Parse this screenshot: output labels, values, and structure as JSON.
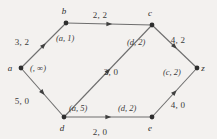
{
  "figure": {
    "type": "flow-network-diagram",
    "background_color": "#f3f1ef",
    "edge_color": "#6e6e6e",
    "node_color": "#2e2e2e",
    "text_color": "#3b3b3b"
  },
  "nodes": [
    {
      "id": "a",
      "label": "a",
      "x": 21,
      "y": 68,
      "label_dx": -11,
      "label_dy": -4
    },
    {
      "id": "b",
      "label": "b",
      "x": 66,
      "y": 23,
      "label_dx": -2,
      "label_dy": -16
    },
    {
      "id": "c",
      "label": "c",
      "x": 152,
      "y": 25,
      "label_dx": -2,
      "label_dy": -16
    },
    {
      "id": "d",
      "label": "d",
      "x": 64,
      "y": 117,
      "label_dx": -2,
      "label_dy": 7
    },
    {
      "id": "e",
      "label": "e",
      "x": 152,
      "y": 117,
      "label_dx": -2,
      "label_dy": 7
    },
    {
      "id": "z",
      "label": "z",
      "x": 197,
      "y": 68,
      "label_dx": 6,
      "label_dy": -4
    }
  ],
  "edges": [
    {
      "id": "a-b",
      "from": "a",
      "to": "b",
      "capacity_flow": "3, 2",
      "cap_x": 22,
      "cap_y": 38
    },
    {
      "id": "b-c",
      "from": "b",
      "to": "c",
      "capacity_flow": "2, 2",
      "cap_x": 100,
      "cap_y": 11
    },
    {
      "id": "c-z",
      "from": "c",
      "to": "z",
      "capacity_flow": "4, 2",
      "cap_x": 178,
      "cap_y": 36
    },
    {
      "id": "a-d",
      "from": "a",
      "to": "d",
      "capacity_flow": "5, 0",
      "cap_x": 22,
      "cap_y": 97
    },
    {
      "id": "d-c",
      "from": "d",
      "to": "c",
      "capacity_flow": "2, 0",
      "cap_x": 111,
      "cap_y": 68
    },
    {
      "id": "d-e",
      "from": "d",
      "to": "e",
      "capacity_flow": "2, 0",
      "cap_x": 100,
      "cap_y": 128
    },
    {
      "id": "e-z",
      "from": "e",
      "to": "z",
      "capacity_flow": "4, 0",
      "cap_x": 178,
      "cap_y": 101
    }
  ],
  "node_labels": [
    {
      "id": "label-b",
      "node": "b",
      "text": "(a, 1)",
      "x": 56,
      "y": 34
    },
    {
      "id": "label-a",
      "node": "a",
      "text": "(, ∞)",
      "x": 30,
      "y": 64
    },
    {
      "id": "label-c",
      "node": "c",
      "text": "(d, 2)",
      "x": 127,
      "y": 38
    },
    {
      "id": "label-z",
      "node": "z",
      "text": "(c, 2)",
      "x": 163,
      "y": 68
    },
    {
      "id": "label-d",
      "node": "d",
      "text": "(a, 5)",
      "x": 69,
      "y": 104
    },
    {
      "id": "label-e",
      "node": "e",
      "text": "(d, 2)",
      "x": 118,
      "y": 104
    }
  ]
}
